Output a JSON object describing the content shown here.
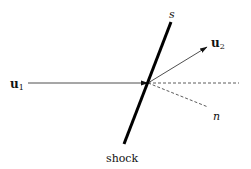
{
  "diagram": {
    "labels": {
      "shock_tangent": "s",
      "normal": "n",
      "shock": "shock",
      "u1_base": "u",
      "u1_sub": "1",
      "u2_base": "u",
      "u2_sub": "2"
    },
    "colors": {
      "line": "#111111",
      "background": "#ffffff"
    }
  }
}
